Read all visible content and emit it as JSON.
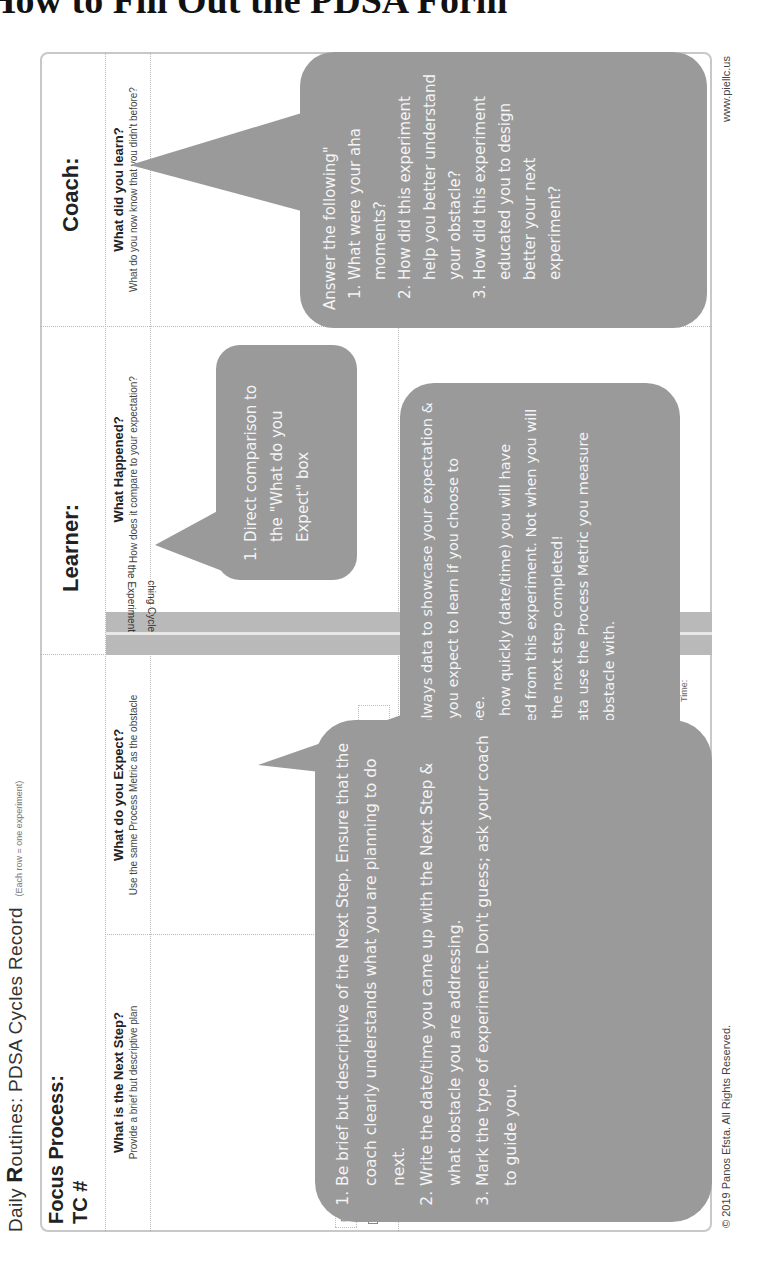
{
  "page": {
    "heading": "How to Fill Out the PDSA Form"
  },
  "form": {
    "title_prefix_a": "Daily ",
    "title_bold": "R",
    "title_rest": "outines: PDSA Cycles Record",
    "title_note": "(Each row = one experiment)",
    "focus_process_label": "Focus Process:",
    "tc_label": "TC #",
    "learner_label": "Learner:",
    "coach_label": "Coach:",
    "columns": [
      {
        "heading": "What is the Next Step?",
        "subheading": "Provide a brief but descriptive plan"
      },
      {
        "heading": "What do you Expect?",
        "subheading": "Use the same Process Metric as the obstacle"
      },
      {
        "heading": "What Happened?",
        "subheading": "How does it compare to your expectation?"
      },
      {
        "heading": "What did you learn?",
        "subheading": "What do you now know that you didn't before?"
      }
    ],
    "strip_labels": {
      "top": "the Experiment",
      "bottom": "ching Cycle"
    },
    "next_step_fields": {
      "date": "Date:",
      "time": "Time:",
      "obs": "Obs:"
    },
    "experiment_types": [
      "Go & See",
      "Hypothesis",
      "Exploratory",
      "JI",
      "JR"
    ],
    "expect_fields": {
      "date": "Date",
      "time": "Time"
    },
    "row2_time": "Time:"
  },
  "callouts": {
    "coach": {
      "intro": "Answer the following\"",
      "items": [
        "What were your aha moments?",
        "How did this experiment help you better understand your obstacle?",
        "How did this experiment educated you to design better your next experiment?"
      ]
    },
    "happened": {
      "items": [
        "Direct comparison to the \"What do you Expect\" box"
      ]
    },
    "expect": {
      "items": [
        "Use always data to showcase your expectation & what you expect to learn if you choose to Go&See.",
        "Write how quickly (date/time) you will have learned from this experiment. Not when you will have the next step completed!",
        "For data use the Process Metric you measure your obstacle with."
      ]
    },
    "next_step": {
      "items": [
        "Be brief but descriptive of the Next Step. Ensure that the coach clearly understands what you are planning to do next.",
        "Write the date/time you came up with the Next Step & what obstacle you are addressing.",
        "Mark the type of experiment. Don't guess; ask your coach to guide you."
      ]
    }
  },
  "footer": {
    "copyright": "© 2019 Panos Efsta. All Rights Reserved.",
    "website": "www.piellc.us"
  },
  "colors": {
    "callout_fill": "#9a9a9a",
    "callout_text": "#f4f4f4",
    "strip_fill": "#b9b9b9",
    "border": "#c8c8c8"
  }
}
